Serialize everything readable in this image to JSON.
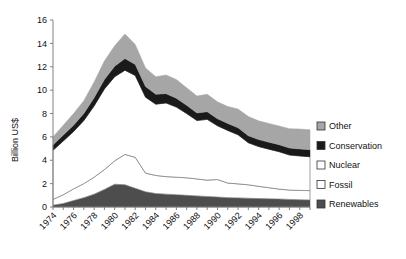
{
  "chart_data": {
    "type": "area",
    "stacked": true,
    "title": "",
    "xlabel": "",
    "ylabel": "Billion US$",
    "ylim": [
      0,
      16
    ],
    "yticks": [
      0,
      2,
      4,
      6,
      8,
      10,
      12,
      14,
      16
    ],
    "ytick_labels": [
      "0",
      "2",
      "4",
      "6",
      "8",
      "10",
      "12",
      "14",
      "16"
    ],
    "xlim": [
      1974,
      1999
    ],
    "xticks": [
      1974,
      1976,
      1978,
      1980,
      1982,
      1984,
      1986,
      1988,
      1990,
      1992,
      1994,
      1996,
      1998
    ],
    "xtick_labels": [
      "1974",
      "1976",
      "1978",
      "1980",
      "1982",
      "1984",
      "1986",
      "1988",
      "1990",
      "1992",
      "1994",
      "1996",
      "1998"
    ],
    "x": [
      1974,
      1975,
      1976,
      1977,
      1978,
      1979,
      1980,
      1981,
      1982,
      1983,
      1984,
      1985,
      1986,
      1987,
      1988,
      1989,
      1990,
      1991,
      1992,
      1993,
      1994,
      1995,
      1996,
      1997,
      1998,
      1999
    ],
    "grid": false,
    "legend_position": "right",
    "series": [
      {
        "name": "Renewables",
        "color": "#4d4d4d",
        "values": [
          0.15,
          0.3,
          0.55,
          0.8,
          1.1,
          1.5,
          1.95,
          1.9,
          1.6,
          1.3,
          1.15,
          1.1,
          1.05,
          1.0,
          0.95,
          0.9,
          0.85,
          0.8,
          0.78,
          0.75,
          0.72,
          0.7,
          0.68,
          0.65,
          0.62,
          0.6
        ]
      },
      {
        "name": "Fossil",
        "color": "#ffffff",
        "values": [
          0.5,
          0.75,
          1.0,
          1.2,
          1.45,
          1.7,
          2.0,
          2.6,
          2.65,
          1.6,
          1.55,
          1.5,
          1.5,
          1.5,
          1.45,
          1.4,
          1.5,
          1.25,
          1.2,
          1.15,
          1.05,
          0.95,
          0.85,
          0.8,
          0.8,
          0.8
        ]
      },
      {
        "name": "Nuclear",
        "color": "#ffffff",
        "values": [
          4.2,
          4.6,
          4.9,
          5.4,
          6.1,
          6.9,
          7.2,
          7.2,
          7.0,
          6.5,
          6.1,
          6.3,
          6.0,
          5.5,
          5.0,
          5.2,
          4.6,
          4.5,
          4.2,
          3.6,
          3.4,
          3.3,
          3.2,
          3.0,
          2.95,
          2.9
        ]
      },
      {
        "name": "Conservation",
        "color": "#1a1a1a",
        "values": [
          0.45,
          0.5,
          0.55,
          0.6,
          0.7,
          0.8,
          0.9,
          1.0,
          0.95,
          0.9,
          0.85,
          0.8,
          0.75,
          0.7,
          0.65,
          0.65,
          0.6,
          0.6,
          0.6,
          0.6,
          0.6,
          0.6,
          0.6,
          0.6,
          0.6,
          0.6
        ]
      },
      {
        "name": "Other",
        "color": "#a6a6a6",
        "values": [
          0.7,
          0.85,
          1.0,
          1.1,
          1.35,
          1.6,
          1.75,
          2.1,
          1.7,
          1.6,
          1.5,
          1.6,
          1.6,
          1.5,
          1.45,
          1.5,
          1.45,
          1.45,
          1.6,
          1.65,
          1.6,
          1.6,
          1.6,
          1.65,
          1.7,
          1.7
        ]
      }
    ],
    "totals": [
      6.0,
      7.0,
      8.0,
      9.1,
      10.7,
      12.5,
      13.8,
      14.8,
      13.9,
      11.9,
      11.15,
      11.3,
      10.9,
      10.2,
      9.5,
      9.65,
      9.0,
      8.6,
      8.38,
      7.75,
      7.37,
      7.15,
      6.93,
      6.7,
      6.67,
      6.6
    ]
  },
  "legend": {
    "items": [
      {
        "label": "Other",
        "swatch": "#a6a6a6"
      },
      {
        "label": "Conservation",
        "swatch": "#1a1a1a"
      },
      {
        "label": "Nuclear",
        "swatch": "#ffffff"
      },
      {
        "label": "Fossil",
        "swatch": "#ffffff"
      },
      {
        "label": "Renewables",
        "swatch": "#4d4d4d"
      }
    ]
  },
  "axis": {
    "line_color": "#808080",
    "text_color": "#111111"
  }
}
